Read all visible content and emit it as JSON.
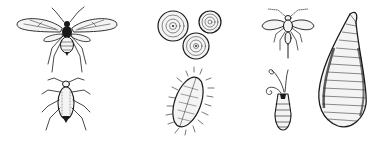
{
  "illustration": {
    "style": "black ink scientific line drawing on white",
    "background": "#ffffff",
    "ink_color": "#1a1a1a",
    "figures": [
      {
        "id": "winged-aphid",
        "icon": "winged-insect-icon"
      },
      {
        "id": "wingless-aphid",
        "icon": "wingless-insect-icon"
      },
      {
        "id": "round-scales",
        "icon": "round-scale-cluster-icon",
        "count": 3
      },
      {
        "id": "mealybug",
        "icon": "mealybug-icon"
      },
      {
        "id": "whitefly-adult",
        "icon": "small-winged-insect-icon"
      },
      {
        "id": "male-scale",
        "icon": "antennae-insect-icon"
      },
      {
        "id": "oyster-scale",
        "icon": "oyster-scale-icon"
      }
    ]
  }
}
